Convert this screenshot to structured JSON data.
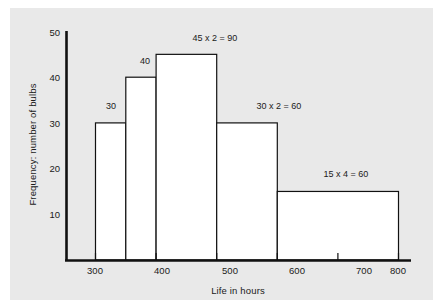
{
  "chart_data": {
    "type": "bar",
    "title": "",
    "subtitle": "",
    "xlabel": "Life in hours",
    "ylabel": "Frequency: number of bulbs",
    "xlim": [
      250,
      820
    ],
    "ylim": [
      0,
      50
    ],
    "grid": false,
    "legend": null,
    "x_ticks": [
      "300",
      "400",
      "500",
      "600",
      "700",
      "800"
    ],
    "x_tick_values": [
      300,
      400,
      500,
      600,
      700,
      800
    ],
    "y_ticks": [
      "10",
      "20",
      "30",
      "40",
      "50"
    ],
    "y_tick_values": [
      10,
      20,
      30,
      40,
      50
    ],
    "bins": [
      {
        "start": 300,
        "end": 350,
        "height": 30,
        "label": "30"
      },
      {
        "start": 350,
        "end": 400,
        "height": 40,
        "label": "40"
      },
      {
        "start": 400,
        "end": 500,
        "height": 45,
        "label": "45 x 2 = 90"
      },
      {
        "start": 500,
        "end": 600,
        "height": 30,
        "label": "30 x 2 = 60"
      },
      {
        "start": 600,
        "end": 800,
        "height": 15,
        "label": "15 x 4 = 60"
      }
    ],
    "categories": [
      "300-350",
      "350-400",
      "400-500",
      "500-600",
      "600-800"
    ],
    "values": [
      30,
      40,
      45,
      30,
      15
    ],
    "annotations": [
      "30",
      "40",
      "45 x 2 = 90",
      "30 x 2 = 60",
      "15 x 4 = 60"
    ]
  },
  "style": {
    "page_background": "#ffffff",
    "panel_background": "#e9e9e9",
    "axis_color": "#111111",
    "bar_edge_color": "#111111",
    "bar_fill_color": "#ffffff",
    "text_color": "#1a1a1a"
  }
}
